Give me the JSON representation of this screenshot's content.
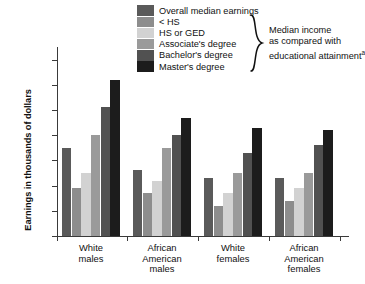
{
  "chart_data": {
    "type": "bar",
    "title": "",
    "subtitle": "",
    "xlabel": "",
    "ylabel": "Earnings  in thousands of dollars",
    "ylim": [
      0,
      75
    ],
    "yticks": [
      0,
      10,
      20,
      30,
      40,
      50,
      60,
      70
    ],
    "ytick_labels": [
      "0",
      "10",
      "20",
      "30",
      "40",
      "50",
      "60",
      "$70"
    ],
    "grid": false,
    "legend_position": "top-center",
    "categories": [
      "White males",
      "African American males",
      "White females",
      "African American females"
    ],
    "category_lines": [
      [
        "White",
        "males"
      ],
      [
        "African",
        "American",
        "males"
      ],
      [
        "White",
        "females"
      ],
      [
        "African",
        "American",
        "females"
      ]
    ],
    "series": [
      {
        "name": "Overall median earnings",
        "color": "#5a5a5a",
        "values": [
          35,
          26,
          23,
          23
        ]
      },
      {
        "name": "< HS",
        "color": "#8d8d8d",
        "values": [
          19,
          17,
          12,
          14
        ]
      },
      {
        "name": "HS or GED",
        "color": "#d2d2d2",
        "values": [
          25,
          22,
          17,
          19
        ]
      },
      {
        "name": "Associate's degree",
        "color": "#9a9a9a",
        "values": [
          40,
          35,
          25,
          25
        ]
      },
      {
        "name": "Bachelor's degree",
        "color": "#515151",
        "values": [
          51,
          40,
          33,
          36
        ]
      },
      {
        "name": "Master's degree",
        "color": "#1c1c1c",
        "values": [
          62,
          47,
          43,
          42
        ]
      }
    ],
    "annotations": [
      {
        "name": "legend-bracket-note",
        "text": "Median income as compared with educational attainment",
        "superscript": "a"
      }
    ]
  },
  "legend": {
    "items": [
      {
        "label": "Overall median earnings",
        "swatch_color": "#5a5a5a"
      },
      {
        "label": "< HS",
        "swatch_color": "#8d8d8d"
      },
      {
        "label": "HS or GED",
        "swatch_color": "#d2d2d2"
      },
      {
        "label": "Associate's degree",
        "swatch_color": "#9a9a9a"
      },
      {
        "label": "Bachelor's degree",
        "swatch_color": "#515151"
      },
      {
        "label": "Master's degree",
        "swatch_color": "#1c1c1c"
      }
    ],
    "note_line1": "Median income",
    "note_line2": "as compared with",
    "note_line3": "educational attainment",
    "note_superscript": "a"
  },
  "axes": {
    "y_axis_title": "Earnings  in thousands of dollars"
  }
}
